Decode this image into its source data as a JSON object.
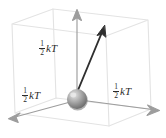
{
  "figure": {
    "type": "physics-diagram",
    "background_color": "#ffffff",
    "width": 166,
    "height": 138
  },
  "colors": {
    "box_wire": "#e2e2e2",
    "axis_arrow": "#9a9a9a",
    "vector_arrow": "#2b2b2b",
    "label_text": "#2b2b2b",
    "sphere_light": "#d8d8d8",
    "sphere_mid": "#9e9e9e",
    "sphere_dark": "#6a6a6a"
  },
  "labels": {
    "vertical": {
      "numerator": "1",
      "denominator": "2",
      "symbol": "kT",
      "full": "1/2 kT"
    },
    "left": {
      "numerator": "1",
      "denominator": "2",
      "symbol": "kT",
      "full": "1/2 kT"
    },
    "right": {
      "numerator": "1",
      "denominator": "2",
      "symbol": "kT",
      "full": "1/2 kT"
    }
  },
  "elements": {
    "box_name": "wireframe-cube",
    "sphere_name": "particle-sphere",
    "vertical_axis_name": "vertical-axis-arrow",
    "left_axis_name": "left-axis-arrow",
    "right_axis_name": "right-axis-arrow",
    "vector_name": "velocity-vector-arrow"
  },
  "geometry": {
    "sphere_center": [
      77,
      99
    ],
    "sphere_radius": 10,
    "vertical_arrow_tip": [
      77,
      10
    ],
    "left_arrow_tip": [
      9,
      118
    ],
    "right_arrow_tip": [
      159,
      110
    ],
    "vector_tip": [
      104,
      27
    ]
  }
}
